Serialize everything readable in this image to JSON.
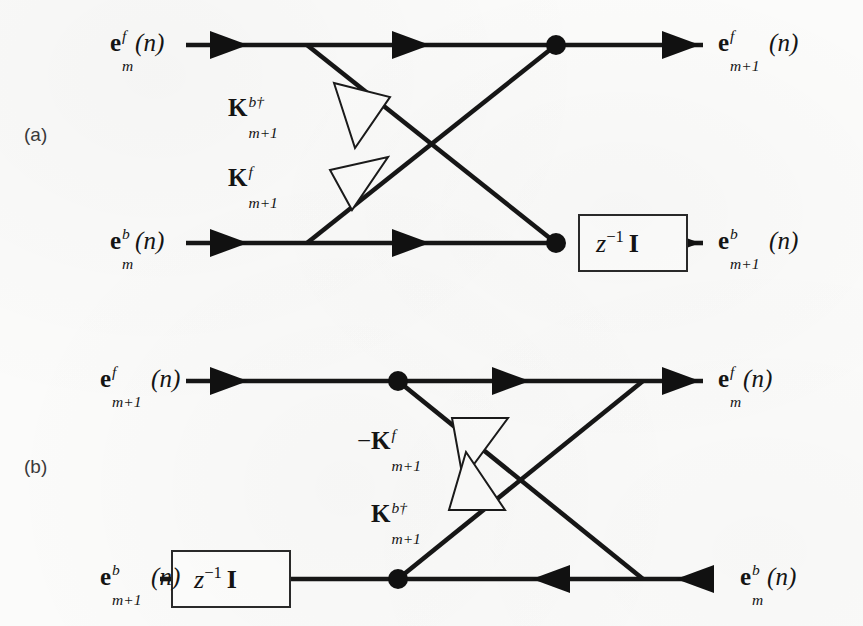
{
  "figure": {
    "type": "signal-flow-graph",
    "background_color": "#fbfbfa",
    "line_color": "#161616"
  },
  "panels": [
    {
      "tag": "(a)",
      "name": "panel-a",
      "direction": "left-to-right",
      "inputs": [
        {
          "id": "a-in-top",
          "text_parts": {
            "base": "e",
            "sup": "f",
            "sub": "m",
            "arg": "(n)"
          }
        },
        {
          "id": "a-in-bot",
          "text_parts": {
            "base": "e",
            "sup": "b",
            "sub": "m",
            "arg": "(n)"
          }
        }
      ],
      "outputs": [
        {
          "id": "a-out-top",
          "text_parts": {
            "base": "e",
            "sup": "f",
            "sub": "m+1",
            "arg": "(n)"
          }
        },
        {
          "id": "a-out-bot",
          "text_parts": {
            "base": "e",
            "sup": "b",
            "sub": "m+1",
            "arg": "(n)"
          }
        }
      ],
      "gains": [
        {
          "id": "a-gain-top",
          "sign": "",
          "base": "K",
          "sup": "b†",
          "sub": "m+1",
          "triangle": "right"
        },
        {
          "id": "a-gain-bot",
          "sign": "",
          "base": "K",
          "sup": "f",
          "sub": "m+1",
          "triangle": "right"
        }
      ],
      "delay": {
        "id": "a-delay",
        "z": "z",
        "exp": "−1",
        "matrix": "I"
      }
    },
    {
      "tag": "(b)",
      "name": "panel-b",
      "direction": "mixed",
      "inputs": [
        {
          "id": "b-in-top",
          "text_parts": {
            "base": "e",
            "sup": "f",
            "sub": "m+1",
            "arg": "(n)"
          }
        },
        {
          "id": "b-in-bot",
          "text_parts": {
            "base": "e",
            "sup": "b",
            "sub": "m",
            "arg": "(n)"
          }
        }
      ],
      "outputs": [
        {
          "id": "b-out-top",
          "text_parts": {
            "base": "e",
            "sup": "f",
            "sub": "m",
            "arg": "(n)"
          }
        },
        {
          "id": "b-out-bot",
          "text_parts": {
            "base": "e",
            "sup": "b",
            "sub": "m+1",
            "arg": "(n)"
          }
        }
      ],
      "gains": [
        {
          "id": "b-gain-top",
          "sign": "−",
          "base": "K",
          "sup": "f",
          "sub": "m+1",
          "triangle": "left"
        },
        {
          "id": "b-gain-bot",
          "sign": "",
          "base": "K",
          "sup": "b†",
          "sub": "m+1",
          "triangle": "right"
        }
      ],
      "delay": {
        "id": "b-delay",
        "z": "z",
        "exp": "−1",
        "matrix": "I"
      }
    }
  ],
  "labels": {
    "panel_a_tag": "(a)",
    "panel_b_tag": "(b)",
    "e": "e",
    "K": "K",
    "z": "z",
    "z_exp": "−1",
    "identity": "I",
    "minus": "−",
    "sup_f": "f",
    "sup_b": "b",
    "sup_bdag": "b†",
    "sub_m": "m",
    "sub_mp1": "m+1",
    "arg_n": "(n)"
  }
}
